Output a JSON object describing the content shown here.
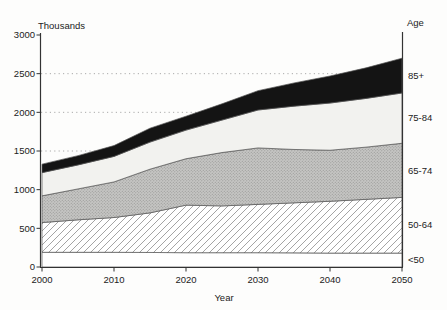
{
  "colors": {
    "background": "#fdfdfc",
    "axis": "#333333",
    "text": "#222222",
    "grid": "#aaaaaa",
    "band_outline": "#555555",
    "hatch_line": "#9a9a9a",
    "stipple_bg": "#c5c5c3",
    "stipple_dot": "#91918f",
    "light_band": "#f2f2ef",
    "dark_band": "#141414",
    "white_band": "#ffffff"
  },
  "chart_data": {
    "type": "area",
    "stacked": true,
    "title": "",
    "ylabel": "Thousands",
    "y2label": "Age",
    "xlabel": "Year",
    "ylim": [
      0,
      3000
    ],
    "xlim": [
      2000,
      2050
    ],
    "y_ticks": [
      0,
      500,
      1000,
      1500,
      2000,
      2500,
      3000
    ],
    "x_ticks": [
      2000,
      2010,
      2020,
      2030,
      2040,
      2050
    ],
    "gridlines_y": [
      1500,
      2000,
      2500
    ],
    "grid_style": "dotted",
    "legend_position": "right-edge-band-labels",
    "x": [
      2000,
      2005,
      2010,
      2015,
      2020,
      2025,
      2030,
      2035,
      2040,
      2045,
      2050
    ],
    "series": [
      {
        "name": "<50",
        "key": "under-50",
        "fill": "white",
        "values": [
          190,
          190,
          190,
          188,
          185,
          185,
          185,
          183,
          180,
          180,
          180
        ]
      },
      {
        "name": "50-64",
        "key": "50-64",
        "fill": "hatch",
        "values": [
          385,
          420,
          450,
          512,
          615,
          605,
          625,
          647,
          670,
          695,
          720
        ]
      },
      {
        "name": "65-74",
        "key": "65-74",
        "fill": "stipple",
        "values": [
          345,
          400,
          460,
          565,
          600,
          690,
          730,
          690,
          660,
          675,
          700
        ]
      },
      {
        "name": "75-84",
        "key": "75-84",
        "fill": "lightgray",
        "values": [
          300,
          310,
          330,
          350,
          370,
          420,
          490,
          560,
          610,
          630,
          650
        ]
      },
      {
        "name": "85+",
        "key": "85-plus",
        "fill": "black",
        "values": [
          110,
          120,
          140,
          180,
          180,
          210,
          250,
          300,
          350,
          395,
          450
        ]
      }
    ],
    "cumulative_totals_by_decade": {
      "years": [
        2000,
        2010,
        2020,
        2030,
        2040,
        2050
      ],
      "total": [
        1330,
        1570,
        1950,
        2280,
        2470,
        2700
      ]
    }
  }
}
